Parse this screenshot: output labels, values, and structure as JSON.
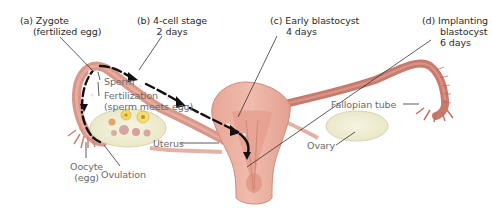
{
  "diagram": {
    "stage_labels": [
      {
        "id": "a",
        "line1": "(a) Zygote",
        "line2": "(fertilized egg)"
      },
      {
        "id": "b",
        "line1": "(b) 4-cell stage",
        "line2": "2 days"
      },
      {
        "id": "c",
        "line1": "(c) Early blastocyst",
        "line2": "4 days"
      },
      {
        "id": "d",
        "line1": "(d) Implanting",
        "line2": "blastocyst",
        "line3": "6 days"
      }
    ],
    "anatomy_labels": {
      "sperm": "Sperm",
      "fertilization_line1": "Fertilization",
      "fertilization_line2": "(sperm meets egg)",
      "oocyte_line1": "Oocyte",
      "oocyte_line2": "(egg)",
      "ovulation": "Ovulation",
      "uterus": "Uterus",
      "fallopian_tube": "Fallopian tube",
      "ovary": "Ovary"
    },
    "colors": {
      "tissue": "#d99a8a",
      "tissue_dark": "#c77866",
      "tube_right": "#c8766a",
      "uterus_fill": "#e8aea0",
      "uterus_inner": "#d98f80",
      "ovary_fill": "#f1efd6",
      "ovary_stroke": "#d8d3b0",
      "follicle_yellow": "#f0d760",
      "follicle_pink": "#dca7a0",
      "arrow": "#111111",
      "leader_line": "#333333",
      "stage_text": "#2b2b2b",
      "part_text": "#6a6a6a"
    }
  }
}
